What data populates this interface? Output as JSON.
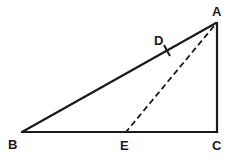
{
  "diagram": {
    "type": "geometry",
    "stroke_color": "#1a1a1a",
    "background": "#ffffff",
    "points": {
      "A": {
        "label": "A",
        "x": 216,
        "y": 23
      },
      "B": {
        "label": "B",
        "x": 22,
        "y": 132
      },
      "C": {
        "label": "C",
        "x": 217,
        "y": 132
      },
      "D": {
        "label": "D",
        "x": 167,
        "y": 51
      },
      "E": {
        "label": "E",
        "x": 126,
        "y": 132
      }
    },
    "segments": [
      {
        "from": "A",
        "to": "B",
        "style": "solid"
      },
      {
        "from": "B",
        "to": "C",
        "style": "solid"
      },
      {
        "from": "C",
        "to": "A",
        "style": "solid"
      },
      {
        "from": "A",
        "to": "E",
        "style": "dashed"
      }
    ],
    "tick_marks": [
      {
        "on_segment": "AB",
        "at": "D"
      }
    ],
    "labels": {
      "A": "A",
      "B": "B",
      "C": "C",
      "D": "D",
      "E": "E"
    }
  }
}
